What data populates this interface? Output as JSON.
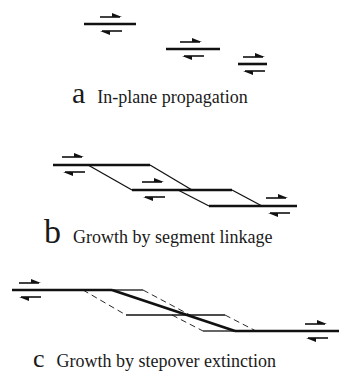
{
  "figure": {
    "panels": [
      {
        "letter": "a",
        "caption": "In-plane propagation",
        "faults": [
          {
            "x1": 84,
            "x2": 136,
            "y": 24,
            "arrow_upper": {
              "x1": 100,
              "x2": 120,
              "dir": "right"
            },
            "arrow_lower": {
              "x1": 101,
              "x2": 121,
              "dir": "left"
            }
          },
          {
            "x1": 166,
            "x2": 220,
            "y": 49,
            "arrow_upper": {
              "x1": 180,
              "x2": 202,
              "dir": "right"
            },
            "arrow_lower": {
              "x1": 182,
              "x2": 203,
              "dir": "left"
            }
          },
          {
            "x1": 238,
            "x2": 267,
            "y": 64,
            "arrow_upper": {
              "x1": 243,
              "x2": 264,
              "dir": "right"
            },
            "arrow_lower": {
              "x1": 243,
              "x2": 264,
              "dir": "left"
            }
          }
        ]
      },
      {
        "letter": "b",
        "caption": "Growth by segment linkage"
      },
      {
        "letter": "c",
        "caption": "Growth by stepover extinction"
      }
    ],
    "colors": {
      "line": "#111111",
      "background": "#ffffff"
    }
  }
}
